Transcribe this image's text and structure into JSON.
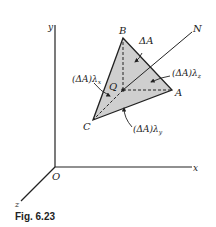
{
  "figure": {
    "caption": "Fig. 6.23",
    "colors": {
      "line": "#222222",
      "triangle_fill": "#cfcfcf",
      "background": "#ffffff"
    },
    "axes": {
      "origin_label": "O",
      "x_label": "x",
      "y_label": "y",
      "z_label": "z"
    },
    "points": {
      "A": "A",
      "B": "B",
      "C": "C",
      "Q": "Q",
      "N": "N"
    },
    "annotations": {
      "area": "ΔA",
      "proj_x": "(ΔA)λ",
      "proj_x_sub": "x",
      "proj_y": "(ΔA)λ",
      "proj_y_sub": "y",
      "proj_z": "(ΔA)λ",
      "proj_z_sub": "z"
    }
  }
}
